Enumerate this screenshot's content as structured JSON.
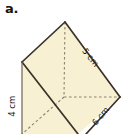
{
  "figure": {
    "part_label": "a.",
    "shape_name": "square-pyramid-3d-figure",
    "fill_color": "#f8f0d2",
    "edge_color": "#3a3228",
    "hidden_edge_color": "#9a8f7a",
    "background_color": "#ffffff",
    "labels": {
      "slant_label": "5 cm",
      "base_label": "6 cm",
      "height_label": "4 cm"
    },
    "dimensions": [
      {
        "name": "slant-edge",
        "value": "5 cm"
      },
      {
        "name": "base-edge",
        "value": "6 cm"
      },
      {
        "name": "vertical-height",
        "value": "4 cm"
      }
    ]
  }
}
